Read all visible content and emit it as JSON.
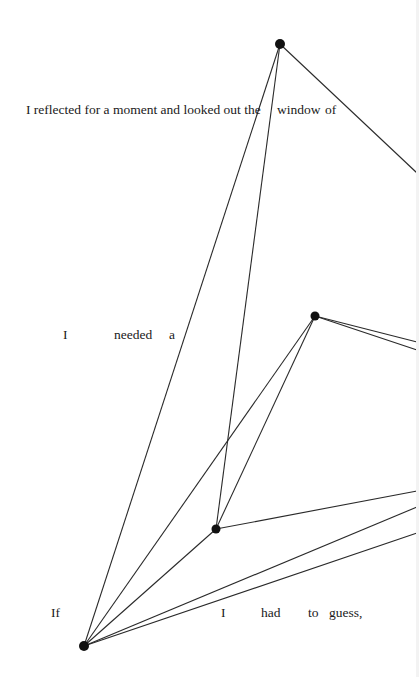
{
  "text_lines": [
    {
      "name": "line-1",
      "words": [
        {
          "text": "I reflected for a moment and looked out the",
          "x": 26,
          "y": 103
        },
        {
          "text": "window",
          "x": 277,
          "y": 103
        },
        {
          "text": "of",
          "x": 325,
          "y": 103
        }
      ]
    },
    {
      "name": "line-2",
      "words": [
        {
          "text": "I",
          "x": 63,
          "y": 328
        },
        {
          "text": "needed",
          "x": 114,
          "y": 328
        },
        {
          "text": "a",
          "x": 169,
          "y": 328
        }
      ]
    },
    {
      "name": "line-3",
      "words": [
        {
          "text": "If",
          "x": 51,
          "y": 606
        },
        {
          "text": "I",
          "x": 221,
          "y": 606
        },
        {
          "text": "had",
          "x": 261,
          "y": 606
        },
        {
          "text": "to",
          "x": 308,
          "y": 606
        },
        {
          "text": "guess,",
          "x": 329,
          "y": 606
        }
      ]
    }
  ],
  "diagram": {
    "line_color": "#2a2a2a",
    "node_color": "#111111",
    "nodes": [
      {
        "id": "A",
        "x": 280,
        "y": 44,
        "r": 5
      },
      {
        "id": "B",
        "x": 315,
        "y": 316,
        "r": 4.5
      },
      {
        "id": "C",
        "x": 216,
        "y": 529,
        "r": 4.5
      },
      {
        "id": "D",
        "x": 84,
        "y": 646,
        "r": 5
      }
    ],
    "edges": [
      {
        "x1": 280,
        "y1": 44,
        "x2": 84,
        "y2": 646
      },
      {
        "x1": 280,
        "y1": 44,
        "x2": 216,
        "y2": 529
      },
      {
        "x1": 280,
        "y1": 44,
        "x2": 417,
        "y2": 173
      },
      {
        "x1": 315,
        "y1": 316,
        "x2": 84,
        "y2": 646
      },
      {
        "x1": 315,
        "y1": 316,
        "x2": 216,
        "y2": 529
      },
      {
        "x1": 315,
        "y1": 316,
        "x2": 417,
        "y2": 342
      },
      {
        "x1": 315,
        "y1": 316,
        "x2": 417,
        "y2": 350
      },
      {
        "x1": 216,
        "y1": 529,
        "x2": 84,
        "y2": 646
      },
      {
        "x1": 216,
        "y1": 529,
        "x2": 417,
        "y2": 491
      },
      {
        "x1": 84,
        "y1": 646,
        "x2": 417,
        "y2": 507
      },
      {
        "x1": 84,
        "y1": 646,
        "x2": 417,
        "y2": 533
      }
    ]
  }
}
